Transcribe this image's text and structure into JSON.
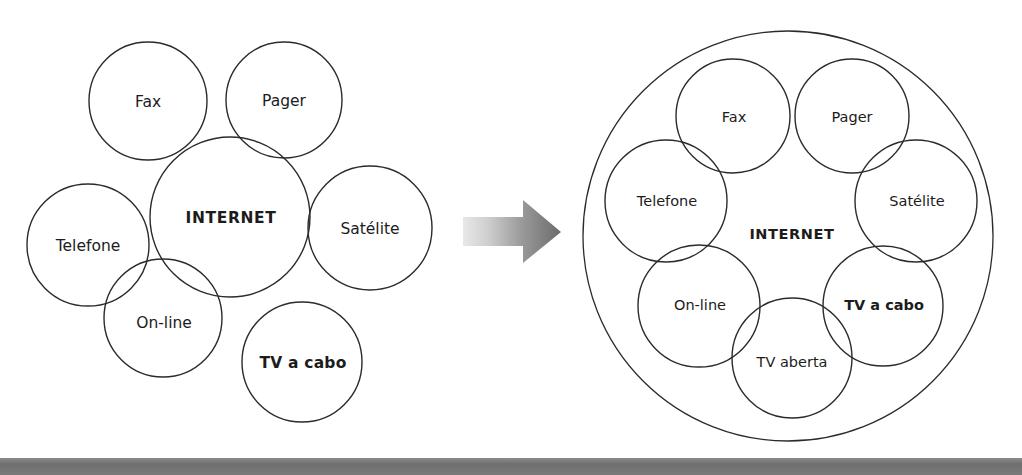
{
  "page": {
    "width": 1022,
    "height": 475,
    "background": "#ffffff",
    "stroke_color": "#2b2b2b",
    "text_color": "#1c1c1c",
    "bottom_bar_color": "#6f6f6f"
  },
  "diagram_left": {
    "name": "overlapping-circles-before",
    "center_node": {
      "label": "INTERNET",
      "bold": true,
      "cx": 230,
      "cy": 217,
      "r": 80
    },
    "nodes": [
      {
        "label": "Fax",
        "bold": false,
        "cx": 148,
        "cy": 101,
        "r": 59
      },
      {
        "label": "Pager",
        "bold": false,
        "cx": 284,
        "cy": 100,
        "r": 58
      },
      {
        "label": "Telefone",
        "bold": false,
        "cx": 88,
        "cy": 245,
        "r": 61
      },
      {
        "label": "Satélite",
        "bold": false,
        "cx": 370,
        "cy": 228,
        "r": 62
      },
      {
        "label": "On-line",
        "bold": false,
        "cx": 163,
        "cy": 318,
        "r": 59
      },
      {
        "label": "TV a cabo",
        "bold": true,
        "cx": 302,
        "cy": 362,
        "r": 60
      }
    ]
  },
  "arrow": {
    "name": "transition-arrow",
    "direction": "right",
    "gradient_from": "#e2e2e2",
    "gradient_to": "#6e6e6e"
  },
  "diagram_right": {
    "name": "enclosed-circles-after",
    "outer_ring": {
      "label": "",
      "cx": 788,
      "cy": 236,
      "r": 205
    },
    "center_node": {
      "label": "INTERNET",
      "bold": true,
      "cx": 790,
      "cy": 235,
      "r": 0
    },
    "nodes": [
      {
        "label": "Fax",
        "bold": false,
        "cx": 733,
        "cy": 116,
        "r": 57
      },
      {
        "label": "Pager",
        "bold": false,
        "cx": 852,
        "cy": 116,
        "r": 57
      },
      {
        "label": "Telefone",
        "bold": false,
        "cx": 666,
        "cy": 201,
        "r": 61
      },
      {
        "label": "Satélite",
        "bold": false,
        "cx": 916,
        "cy": 201,
        "r": 61
      },
      {
        "label": "On-line",
        "bold": false,
        "cx": 699,
        "cy": 306,
        "r": 61
      },
      {
        "label": "TV a cabo",
        "bold": true,
        "cx": 883,
        "cy": 306,
        "r": 60
      },
      {
        "label": "TV aberta",
        "bold": false,
        "cx": 792,
        "cy": 358,
        "r": 60
      }
    ]
  }
}
